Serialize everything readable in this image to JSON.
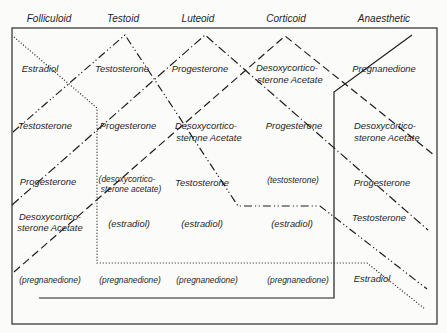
{
  "header": {
    "columns": [
      "Folliculoid",
      "Testoid",
      "Luteoid",
      "Corticoid",
      "Anaesthetic"
    ]
  },
  "rows": [
    [
      {
        "lines": [
          "Estradiol"
        ]
      },
      {
        "lines": [
          "Testosterone"
        ]
      },
      {
        "lines": [
          "Progesterone"
        ]
      },
      {
        "lines": [
          "Desoxycortico-",
          "sterone Acetate"
        ]
      },
      {
        "lines": [
          "Pregnanedione"
        ]
      }
    ],
    [
      {
        "lines": [
          "Testosterone"
        ]
      },
      {
        "lines": [
          "Progesterone"
        ]
      },
      {
        "lines": [
          "Desoxycortico-",
          "sterone Acetate"
        ]
      },
      {
        "lines": [
          "Progesterone"
        ]
      },
      {
        "lines": [
          "Desoxycortico-",
          "sterone Acetate"
        ]
      }
    ],
    [
      {
        "lines": [
          "Progesterone"
        ]
      },
      {
        "lines": [
          "(desoxycortico-",
          "sterone acetate)"
        ]
      },
      {
        "lines": [
          "Testosterone"
        ]
      },
      {
        "lines": [
          "(testosterone)"
        ]
      },
      {
        "lines": [
          "Progesterone"
        ]
      }
    ],
    [
      {
        "lines": [
          "Desoxycortico-",
          "sterone Acetate"
        ]
      },
      {
        "lines": [
          "(estradiol)"
        ]
      },
      {
        "lines": [
          "(estradiol)"
        ]
      },
      {
        "lines": [
          "(estradiol)"
        ]
      },
      {
        "lines": [
          "Testosterone"
        ]
      }
    ],
    [
      {
        "lines": [
          "(pregnanedione)"
        ]
      },
      {
        "lines": [
          "(pregnanedione)"
        ]
      },
      {
        "lines": [
          "(pregnanedione)"
        ]
      },
      {
        "lines": [
          "(pregnanedione)"
        ]
      },
      {
        "lines": [
          "Estradiol"
        ]
      }
    ]
  ],
  "traces": [
    {
      "compound": "Estradiol",
      "style": "dotted",
      "points": [
        [
          14,
          37
        ],
        [
          97,
          108
        ],
        [
          97,
          263
        ],
        [
          367,
          263
        ],
        [
          425,
          309
        ]
      ]
    },
    {
      "compound": "Testosterone",
      "style": "dash-dot-dot",
      "points": [
        [
          13,
          132
        ],
        [
          125,
          35
        ],
        [
          238,
          206
        ],
        [
          320,
          206
        ],
        [
          427,
          289
        ]
      ]
    },
    {
      "compound": "Progesterone",
      "style": "dash-dot",
      "points": [
        [
          12,
          205
        ],
        [
          205,
          35
        ],
        [
          428,
          230
        ]
      ]
    },
    {
      "compound": "Desoxycorticosterone Acetate",
      "style": "dashed",
      "points": [
        [
          14,
          272
        ],
        [
          285,
          36
        ],
        [
          434,
          155
        ]
      ]
    },
    {
      "compound": "Pregnanedione",
      "style": "solid",
      "points": [
        [
          39,
          298
        ],
        [
          334,
          298
        ],
        [
          334,
          92
        ],
        [
          412,
          35
        ]
      ]
    }
  ],
  "colors": {
    "ink": "#1f1f1f",
    "paper": "#fbfbfa"
  }
}
